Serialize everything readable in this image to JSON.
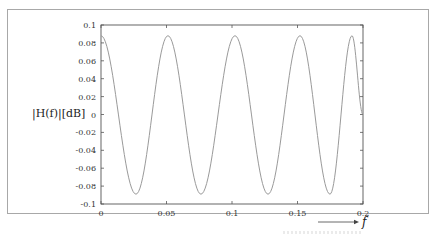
{
  "chart_data": {
    "type": "line",
    "title": "",
    "xlabel": "f",
    "ylabel": "|H(f)|[dB]",
    "xlim": [
      0,
      0.2
    ],
    "ylim": [
      -0.1,
      0.1
    ],
    "grid": false,
    "legend": null,
    "x_ticks": [
      "0",
      "0.05",
      "0.1",
      "0.15",
      "0.2"
    ],
    "x_tick_values": [
      0,
      0.05,
      0.1,
      0.15,
      0.2
    ],
    "y_ticks": [
      "0.1",
      "0.08",
      "0.06",
      "0.04",
      "0.02",
      "0",
      "-0.02",
      "-0.04",
      "-0.06",
      "-0.08",
      "-0.1"
    ],
    "y_tick_values": [
      0.1,
      0.08,
      0.06,
      0.04,
      0.02,
      0,
      -0.02,
      -0.04,
      -0.06,
      -0.08,
      -0.1
    ],
    "series": [
      {
        "name": "|H(f)|",
        "color": "#9a9a9a",
        "extrema_x": [
          0.0,
          0.0267,
          0.0511,
          0.0763,
          0.1023,
          0.1275,
          0.1519,
          0.1748,
          0.1916,
          0.2
        ],
        "extrema_y": [
          0.088,
          -0.089,
          0.088,
          -0.089,
          0.088,
          -0.089,
          0.088,
          -0.089,
          0.088,
          0.0
        ]
      }
    ],
    "annotations": [
      {
        "text": "f",
        "arrow": "right",
        "position": "below x-axis right end"
      }
    ]
  }
}
